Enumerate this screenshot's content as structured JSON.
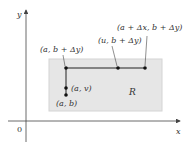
{
  "diagram": {
    "axes": {
      "x_label": "x",
      "y_label": "y",
      "origin_label": "0"
    },
    "region": {
      "label": "R",
      "fill": "#e6e6e6",
      "stroke": "#cfcfcf"
    },
    "points": [
      {
        "id": "a_b_plus_dy",
        "label": "(a, b + Δy)"
      },
      {
        "id": "u_b_plus_dy",
        "label": "(u, b + Δy)"
      },
      {
        "id": "a_plus_dx_b_plus_dy",
        "label": "(a + Δx, b + Δy)"
      },
      {
        "id": "a_v",
        "label": "(a, v)"
      },
      {
        "id": "a_b",
        "label": "(a, b)"
      }
    ],
    "colors": {
      "line": "#222222",
      "axis": "#444444"
    }
  }
}
